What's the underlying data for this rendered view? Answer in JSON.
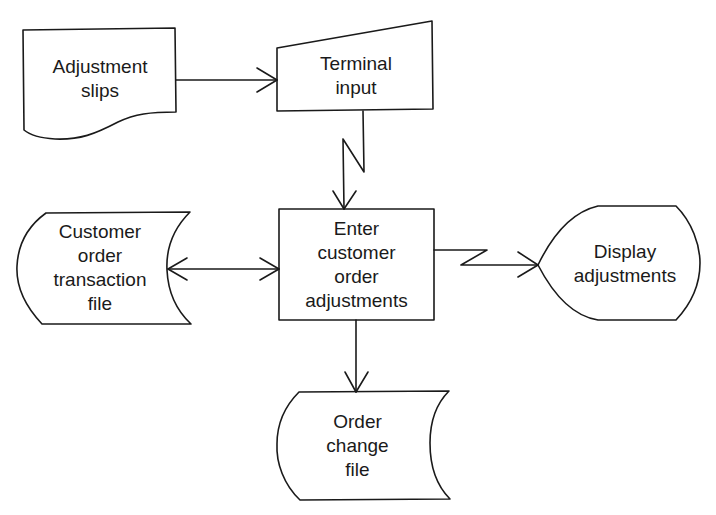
{
  "diagram": {
    "type": "flowchart",
    "nodes": [
      {
        "id": "adjustment_slips",
        "shape": "document",
        "label": "Adjustment\nslips"
      },
      {
        "id": "terminal_input",
        "shape": "manual-input",
        "label": "Terminal\ninput"
      },
      {
        "id": "customer_order_transaction_file",
        "shape": "stored-data",
        "label": "Customer\norder\ntransaction\nfile"
      },
      {
        "id": "enter_customer_order_adjustments",
        "shape": "process",
        "label": "Enter\ncustomer\norder\nadjustments"
      },
      {
        "id": "display_adjustments",
        "shape": "display",
        "label": "Display\nadjustments"
      },
      {
        "id": "order_change_file",
        "shape": "stored-data",
        "label": "Order\nchange\nfile"
      }
    ],
    "edges": [
      {
        "from": "adjustment_slips",
        "to": "terminal_input",
        "style": "arrow"
      },
      {
        "from": "terminal_input",
        "to": "enter_customer_order_adjustments",
        "style": "communication-link"
      },
      {
        "from": "customer_order_transaction_file",
        "to": "enter_customer_order_adjustments",
        "style": "bidirectional-arrow"
      },
      {
        "from": "enter_customer_order_adjustments",
        "to": "display_adjustments",
        "style": "communication-link"
      },
      {
        "from": "enter_customer_order_adjustments",
        "to": "order_change_file",
        "style": "arrow"
      }
    ]
  },
  "colors": {
    "stroke": "#1a1a1a",
    "background": "#ffffff"
  }
}
